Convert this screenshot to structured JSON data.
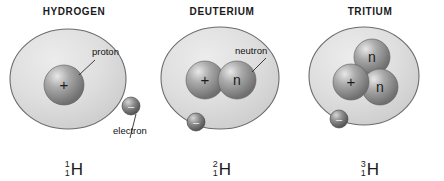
{
  "figure": {
    "background": "#ffffff",
    "ink": "#1a1a1a",
    "cloud_fill": "#d9d9d9",
    "cloud_stroke": "#6b6b6b",
    "nucleon_fill": "#9a9a9a",
    "electron_fill": "#6e6e6e"
  },
  "panels": [
    {
      "id": "hydrogen",
      "title": "HYDROGEN",
      "isotope": {
        "mass_number": "1",
        "atomic_number": "1",
        "symbol": "H"
      },
      "nucleons": [
        {
          "type": "proton",
          "glyph": "+"
        }
      ],
      "electrons": 1,
      "callouts": [
        {
          "id": "proton",
          "label": "proton"
        },
        {
          "id": "electron",
          "label": "electron"
        }
      ]
    },
    {
      "id": "deuterium",
      "title": "DEUTERIUM",
      "isotope": {
        "mass_number": "2",
        "atomic_number": "1",
        "symbol": "H"
      },
      "nucleons": [
        {
          "type": "proton",
          "glyph": "+"
        },
        {
          "type": "neutron",
          "glyph": "n"
        }
      ],
      "electrons": 1,
      "callouts": [
        {
          "id": "neutron",
          "label": "neutron"
        }
      ]
    },
    {
      "id": "tritium",
      "title": "TRITIUM",
      "isotope": {
        "mass_number": "3",
        "atomic_number": "1",
        "symbol": "H"
      },
      "nucleons": [
        {
          "type": "neutron",
          "glyph": "n"
        },
        {
          "type": "proton",
          "glyph": "+"
        },
        {
          "type": "neutron",
          "glyph": "n"
        }
      ],
      "electrons": 1,
      "callouts": []
    }
  ],
  "electron_glyph": "–"
}
